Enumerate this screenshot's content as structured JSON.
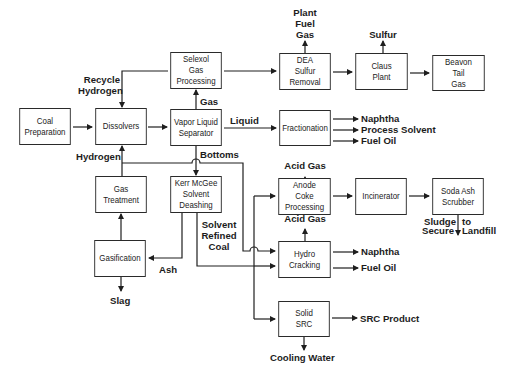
{
  "diagram": {
    "type": "process-flow",
    "title": "",
    "boxes": {
      "coal_preparation": "Coal\nPreparation",
      "dissolvers": "Dissolvers",
      "vapor_liquid_separator": "Vapor Liquid\nSeparator",
      "selexol": "Selexol\nGas\nProcessing",
      "dea": "DEA\nSulfur\nRemoval",
      "claus": "Claus\nPlant",
      "beavon": "Beavon\nTail\nGas",
      "fractionation": "Fractionation",
      "gas_treatment": "Gas\nTreatment",
      "kerr_mcgee": "Kerr McGee\nSolvent\nDeashing",
      "gasification": "Gasification",
      "anode_coke": "Anode\nCoke\nProcessing",
      "incinerator": "Incinerator",
      "soda_ash": "Soda Ash\nScrubber",
      "hydro_cracking": "Hydro\nCracking",
      "solid_src": "Solid\nSRC"
    },
    "labels": {
      "recycle_hydrogen": "Recycle\nHydrogen",
      "plant_fuel_gas": "Plant\nFuel\nGas",
      "sulfur": "Sulfur",
      "gas": "Gas",
      "liquid": "Liquid",
      "naphtha_1": "Naphtha",
      "process_solvent": "Process Solvent",
      "fuel_oil_1": "Fuel Oil",
      "hydrogen": "Hydrogen",
      "bottoms": "Bottoms",
      "acid_gas_1": "Acid Gas",
      "solvent_refined_coal": "Solvent\nRefined\nCoal",
      "ash": "Ash",
      "acid_gas_2": "Acid Gas",
      "sludge": "Sludge",
      "secure": "Secure",
      "to": "to",
      "landfill": "Landfill",
      "naphtha_2": "Naphtha",
      "fuel_oil_2": "Fuel Oil",
      "slag": "Slag",
      "src_product": "SRC Product",
      "cooling_water": "Cooling Water"
    },
    "edges": [
      {
        "from": "Coal Preparation",
        "to": "Dissolvers"
      },
      {
        "from": "Dissolvers",
        "to": "Vapor Liquid Separator"
      },
      {
        "from": "Vapor Liquid Separator",
        "to": "Selexol Gas Processing",
        "label": "Gas"
      },
      {
        "from": "Selexol Gas Processing",
        "to": "Dissolvers",
        "label": "Recycle Hydrogen"
      },
      {
        "from": "Selexol Gas Processing",
        "to": "DEA Sulfur Removal"
      },
      {
        "from": "DEA Sulfur Removal",
        "to": "Plant Fuel Gas"
      },
      {
        "from": "DEA Sulfur Removal",
        "to": "Claus Plant"
      },
      {
        "from": "Claus Plant",
        "to": "Sulfur"
      },
      {
        "from": "Claus Plant",
        "to": "Beavon Tail Gas"
      },
      {
        "from": "Vapor Liquid Separator",
        "to": "Fractionation",
        "label": "Liquid"
      },
      {
        "from": "Fractionation",
        "to": "Naphtha"
      },
      {
        "from": "Fractionation",
        "to": "Process Solvent"
      },
      {
        "from": "Fractionation",
        "to": "Fuel Oil"
      },
      {
        "from": "Vapor Liquid Separator",
        "to": "Kerr McGee Solvent Deashing",
        "label": "Bottoms"
      },
      {
        "from": "Gas Treatment",
        "to": "Dissolvers",
        "label": "Hydrogen"
      },
      {
        "from": "Gas Treatment",
        "to": "Hydro Cracking",
        "label": "Hydrogen"
      },
      {
        "from": "Gasification",
        "to": "Gas Treatment"
      },
      {
        "from": "Gasification",
        "to": "Slag"
      },
      {
        "from": "Kerr McGee Solvent Deashing",
        "to": "Gasification",
        "label": "Ash"
      },
      {
        "from": "Kerr McGee Solvent Deashing",
        "to": "Anode Coke Processing",
        "label": "Solvent Refined Coal"
      },
      {
        "from": "Kerr McGee Solvent Deashing",
        "to": "Hydro Cracking",
        "label": "Solvent Refined Coal"
      },
      {
        "from": "Kerr McGee Solvent Deashing",
        "to": "Solid SRC",
        "label": "Solvent Refined Coal"
      },
      {
        "from": "Anode Coke Processing",
        "to": "Acid Gas"
      },
      {
        "from": "Anode Coke Processing",
        "to": "Incinerator"
      },
      {
        "from": "Incinerator",
        "to": "Soda Ash Scrubber"
      },
      {
        "from": "Soda Ash Scrubber",
        "to": "Sludge to Secure Landfill"
      },
      {
        "from": "Hydro Cracking",
        "to": "Acid Gas"
      },
      {
        "from": "Hydro Cracking",
        "to": "Naphtha"
      },
      {
        "from": "Hydro Cracking",
        "to": "Fuel Oil"
      },
      {
        "from": "Solid SRC",
        "to": "SRC Product"
      },
      {
        "from": "Solid SRC",
        "to": "Cooling Water"
      }
    ]
  },
  "colors": {
    "line": "#1e1e1e",
    "background": "#ffffff",
    "text": "#1c1c1c"
  }
}
